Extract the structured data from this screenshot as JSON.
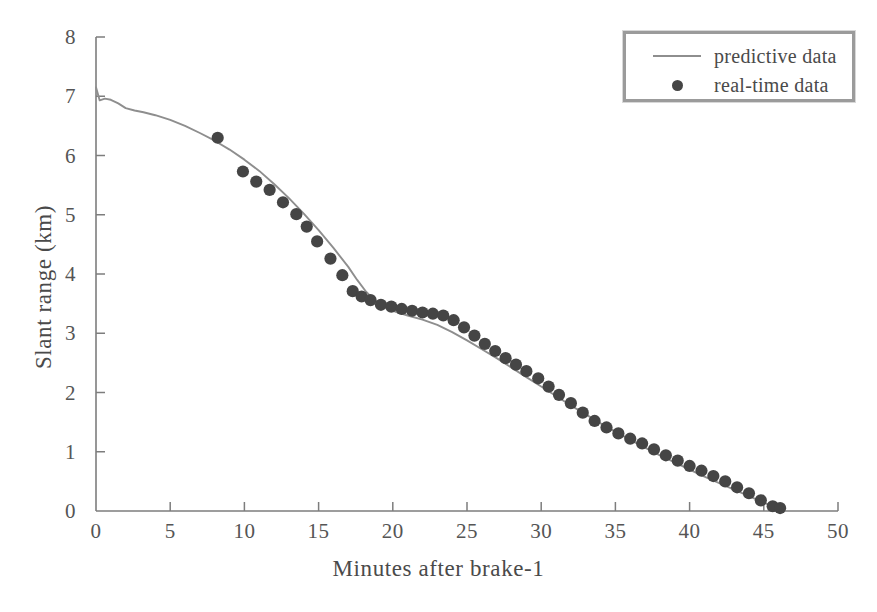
{
  "chart_data": {
    "type": "line",
    "title": "",
    "xlabel": "Minutes after brake-1",
    "ylabel": "Slant range (km)",
    "xlim": [
      0,
      50
    ],
    "ylim": [
      0,
      8
    ],
    "xticks": [
      0,
      5,
      10,
      15,
      20,
      25,
      30,
      35,
      40,
      45,
      50
    ],
    "yticks": [
      0,
      1,
      2,
      3,
      4,
      5,
      6,
      7,
      8
    ],
    "xtick_labels": [
      "0",
      "5",
      "10",
      "15",
      "20",
      "25",
      "30",
      "35",
      "40",
      "45",
      "50"
    ],
    "ytick_labels": [
      "0",
      "1",
      "2",
      "3",
      "4",
      "5",
      "6",
      "7",
      "8"
    ],
    "grid": false,
    "legend_position": "top-right",
    "series": [
      {
        "name": "predictive data",
        "type": "line",
        "color": "#8e8e8e",
        "points": [
          [
            0.0,
            7.15
          ],
          [
            0.25,
            6.93
          ],
          [
            0.6,
            6.96
          ],
          [
            1.0,
            6.94
          ],
          [
            1.5,
            6.88
          ],
          [
            2.0,
            6.8
          ],
          [
            2.6,
            6.76
          ],
          [
            3.2,
            6.73
          ],
          [
            4.0,
            6.68
          ],
          [
            5.0,
            6.6
          ],
          [
            6.0,
            6.5
          ],
          [
            7.0,
            6.38
          ],
          [
            8.0,
            6.25
          ],
          [
            9.0,
            6.1
          ],
          [
            10.0,
            5.93
          ],
          [
            11.0,
            5.74
          ],
          [
            12.0,
            5.52
          ],
          [
            13.0,
            5.28
          ],
          [
            14.0,
            5.02
          ],
          [
            15.0,
            4.74
          ],
          [
            16.0,
            4.44
          ],
          [
            17.0,
            4.12
          ],
          [
            17.6,
            3.9
          ],
          [
            18.2,
            3.7
          ],
          [
            18.8,
            3.55
          ],
          [
            19.5,
            3.44
          ],
          [
            20.2,
            3.36
          ],
          [
            21.0,
            3.3
          ],
          [
            22.0,
            3.23
          ],
          [
            23.0,
            3.14
          ],
          [
            24.0,
            3.02
          ],
          [
            25.0,
            2.88
          ],
          [
            26.0,
            2.73
          ],
          [
            27.0,
            2.58
          ],
          [
            28.0,
            2.42
          ],
          [
            29.0,
            2.26
          ],
          [
            30.0,
            2.1
          ],
          [
            31.0,
            1.94
          ],
          [
            32.0,
            1.78
          ],
          [
            33.0,
            1.63
          ],
          [
            34.0,
            1.48
          ],
          [
            35.0,
            1.34
          ],
          [
            36.0,
            1.2
          ],
          [
            37.0,
            1.07
          ],
          [
            38.0,
            0.94
          ],
          [
            39.0,
            0.82
          ],
          [
            40.0,
            0.7
          ],
          [
            41.0,
            0.58
          ],
          [
            42.0,
            0.47
          ],
          [
            43.0,
            0.36
          ],
          [
            44.0,
            0.25
          ],
          [
            45.0,
            0.14
          ],
          [
            46.0,
            0.04
          ],
          [
            46.3,
            0.0
          ]
        ]
      },
      {
        "name": "real-time data",
        "type": "scatter",
        "color": "#454545",
        "points": [
          [
            8.2,
            6.3
          ],
          [
            9.9,
            5.73
          ],
          [
            10.8,
            5.56
          ],
          [
            11.7,
            5.42
          ],
          [
            12.6,
            5.21
          ],
          [
            13.5,
            5.01
          ],
          [
            14.2,
            4.8
          ],
          [
            14.9,
            4.55
          ],
          [
            15.8,
            4.26
          ],
          [
            16.6,
            3.98
          ],
          [
            17.3,
            3.71
          ],
          [
            17.9,
            3.62
          ],
          [
            18.5,
            3.56
          ],
          [
            19.2,
            3.48
          ],
          [
            19.9,
            3.45
          ],
          [
            20.6,
            3.41
          ],
          [
            21.3,
            3.38
          ],
          [
            22.0,
            3.35
          ],
          [
            22.7,
            3.33
          ],
          [
            23.4,
            3.3
          ],
          [
            24.1,
            3.22
          ],
          [
            24.8,
            3.1
          ],
          [
            25.5,
            2.96
          ],
          [
            26.2,
            2.82
          ],
          [
            26.9,
            2.7
          ],
          [
            27.6,
            2.58
          ],
          [
            28.3,
            2.47
          ],
          [
            29.0,
            2.36
          ],
          [
            29.8,
            2.24
          ],
          [
            30.5,
            2.1
          ],
          [
            31.2,
            1.96
          ],
          [
            32.0,
            1.82
          ],
          [
            32.8,
            1.66
          ],
          [
            33.6,
            1.52
          ],
          [
            34.4,
            1.41
          ],
          [
            35.2,
            1.31
          ],
          [
            36.0,
            1.22
          ],
          [
            36.8,
            1.14
          ],
          [
            37.6,
            1.04
          ],
          [
            38.4,
            0.94
          ],
          [
            39.2,
            0.85
          ],
          [
            40.0,
            0.76
          ],
          [
            40.8,
            0.68
          ],
          [
            41.6,
            0.59
          ],
          [
            42.4,
            0.5
          ],
          [
            43.2,
            0.4
          ],
          [
            44.0,
            0.3
          ],
          [
            44.8,
            0.18
          ],
          [
            45.6,
            0.08
          ],
          [
            46.1,
            0.05
          ]
        ]
      }
    ]
  },
  "legend": {
    "entries": [
      {
        "label": "predictive data",
        "marker": "line"
      },
      {
        "label": "real-time data",
        "marker": "dot"
      }
    ]
  },
  "axes": {
    "x_title": "Minutes after brake-1",
    "y_title": "Slant range (km)"
  }
}
